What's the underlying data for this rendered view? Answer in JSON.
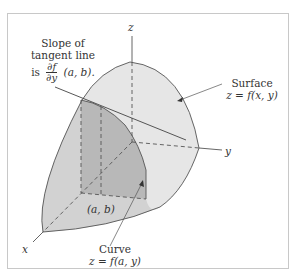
{
  "figure": {
    "axes": {
      "x_label": "x",
      "y_label": "y",
      "z_label": "z"
    },
    "annotations": {
      "slope": {
        "line1": "Slope of",
        "line2": "tangent line",
        "prefix": "is",
        "frac_num": "∂f",
        "frac_den": "∂y",
        "suffix": "(a, b)."
      },
      "surface": {
        "line1": "Surface",
        "line2": "z = f(x, y)"
      },
      "curve": {
        "line1": "Curve",
        "line2": "z = f(a, y)"
      },
      "point": "(a, b)"
    },
    "colors": {
      "surface_light": "#e6e6e6",
      "surface_mid": "#d2d2d2",
      "slice_dark": "#b8b8b8",
      "stroke": "#555555",
      "frame": "#c8c8c8"
    }
  }
}
